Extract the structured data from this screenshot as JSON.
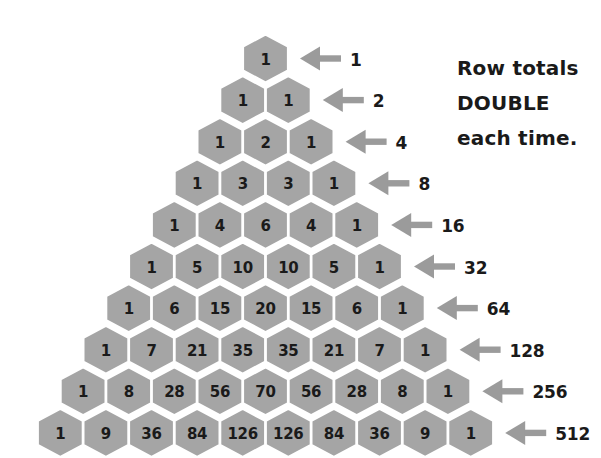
{
  "figure": {
    "title_note": [
      "Row totals",
      "DOUBLE",
      "each time."
    ],
    "hex_fill": "#a5a5a5",
    "hex_stroke": "#ffffff",
    "arrow_color": "#9b9b9b",
    "text_color": "#1a1a1a",
    "background": "#ffffff"
  },
  "chart_data": {
    "type": "table",
    "xlabel": "",
    "ylabel": "",
    "structure": "pascals-triangle-hexagons",
    "rows": [
      {
        "index": 0,
        "values": [
          1
        ],
        "total": 1,
        "total_label": "1"
      },
      {
        "index": 1,
        "values": [
          1,
          1
        ],
        "total": 2,
        "total_label": "2"
      },
      {
        "index": 2,
        "values": [
          1,
          2,
          1
        ],
        "total": 4,
        "total_label": "4"
      },
      {
        "index": 3,
        "values": [
          1,
          3,
          3,
          1
        ],
        "total": 8,
        "total_label": "8"
      },
      {
        "index": 4,
        "values": [
          1,
          4,
          6,
          4,
          1
        ],
        "total": 16,
        "total_label": "16"
      },
      {
        "index": 5,
        "values": [
          1,
          5,
          10,
          10,
          5,
          1
        ],
        "total": 32,
        "total_label": "32"
      },
      {
        "index": 6,
        "values": [
          1,
          6,
          15,
          20,
          15,
          6,
          1
        ],
        "total": 64,
        "total_label": "64"
      },
      {
        "index": 7,
        "values": [
          1,
          7,
          21,
          35,
          35,
          21,
          7,
          1
        ],
        "total": 128,
        "total_label": "128"
      },
      {
        "index": 8,
        "values": [
          1,
          8,
          28,
          56,
          70,
          56,
          28,
          8,
          1
        ],
        "total": 256,
        "total_label": "256"
      },
      {
        "index": 9,
        "values": [
          1,
          9,
          36,
          84,
          126,
          126,
          84,
          36,
          9,
          1
        ],
        "total": 512,
        "total_label": "512"
      }
    ],
    "annotations": [
      "Row totals",
      "DOUBLE",
      "each time."
    ],
    "legend": [],
    "grid": false
  }
}
